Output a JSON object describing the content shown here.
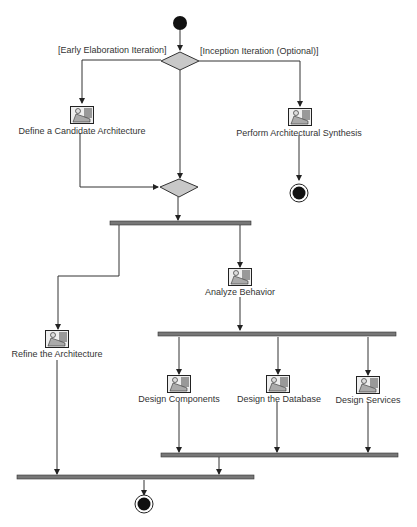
{
  "diagram": {
    "type": "activity",
    "colors": {
      "line": "#333333",
      "decision_fill": "#c8c8c8",
      "bar_fill": "#777777",
      "node_fill": "#111111"
    },
    "guards": {
      "left": "[Early Elaboration Iteration]",
      "right": "[Inception Iteration (Optional)]"
    },
    "activities": {
      "define_candidate": "Define a Candidate Architecture",
      "perform_synthesis": "Perform Architectural Synthesis",
      "analyze_behavior": "Analyze Behavior",
      "refine_architecture": "Refine the Architecture",
      "design_components": "Design Components",
      "design_database": "Design the Database",
      "design_services": "Design Services"
    }
  }
}
